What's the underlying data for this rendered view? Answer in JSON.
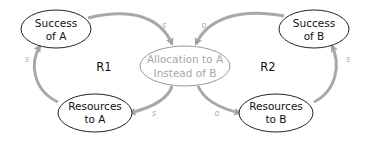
{
  "diagram": {
    "type": "causal-loop",
    "nodes": {
      "success_a": {
        "line1": "Success",
        "line2": "of A"
      },
      "success_b": {
        "line1": "Success",
        "line2": "of B"
      },
      "allocation": {
        "line1": "Allocation to A",
        "line2": "Instead of B"
      },
      "resources_a": {
        "line1": "Resources",
        "line2": "to A"
      },
      "resources_b": {
        "line1": "Resources",
        "line2": "to B"
      }
    },
    "loops": {
      "r1": "R1",
      "r2": "R2"
    },
    "polarities": {
      "success_a_to_allocation": "s",
      "success_b_to_allocation": "o",
      "allocation_to_resources_a": "s",
      "allocation_to_resources_b": "o",
      "resources_a_to_success_a": "s",
      "resources_b_to_success_b": "s"
    },
    "colors": {
      "arrow": "#a0a0a0",
      "node_border": "#222222",
      "grey_node_border": "#9a9a9a"
    }
  }
}
